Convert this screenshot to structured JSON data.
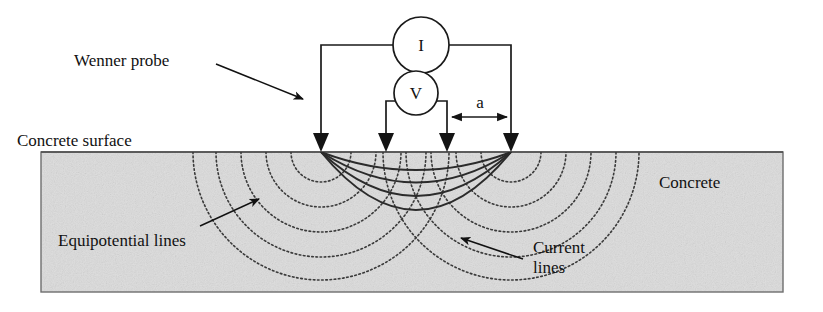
{
  "figure": {
    "title_labels": {
      "wenner_probe": "Wenner probe",
      "concrete_surface": "Concrete surface",
      "concrete": "Concrete",
      "equipotential_lines": "Equipotential lines",
      "current_lines_line1": "Current",
      "current_lines_line2": "lines"
    },
    "meters": {
      "current_meter": "I",
      "voltage_meter": "V"
    },
    "dimension": {
      "spacing_label": "a"
    },
    "colors": {
      "concrete_fill": "#dcdcdc",
      "concrete_edge": "#6e6e6e",
      "wire": "#1a1a1a",
      "current_line": "#2b2b2b",
      "equipotential_line": "#3a3a3a",
      "text": "#111111",
      "background": "#ffffff"
    },
    "geometry": {
      "probe_x_positions": [
        321,
        386,
        447,
        511
      ],
      "surface_y": 152,
      "block_left": 41,
      "block_right": 783,
      "block_top": 152,
      "block_bottom": 292,
      "probe_count": 4,
      "current_arc_count": 4,
      "equipotential_arc_count": 5
    },
    "icons": {
      "probe": "probe-arrow-icon",
      "dimension_arrow": "double-headed-arrow-icon",
      "leader": "leader-arrow-icon"
    }
  }
}
